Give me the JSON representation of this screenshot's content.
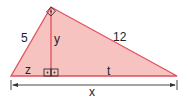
{
  "diagram": {
    "type": "right-triangle-altitude",
    "colors": {
      "fill": "#f6c3c1",
      "stroke": "#e0505e",
      "text": "#222222",
      "arrow": "#333333"
    },
    "labels": {
      "left_side": "5",
      "right_side": "12",
      "altitude": "y",
      "left_segment": "z",
      "right_segment": "t",
      "base": "x"
    },
    "right_angle_markers": [
      "apex",
      "altitude-foot-left",
      "altitude-foot-right"
    ]
  }
}
